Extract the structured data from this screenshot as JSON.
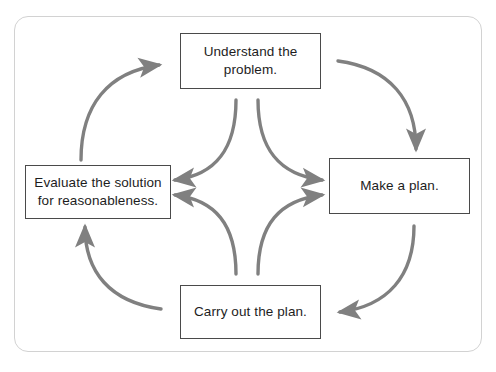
{
  "diagram": {
    "type": "cycle-flowchart",
    "frame_color": "#d2d2d2",
    "arrow_color": "#808080",
    "box_border_color": "#4a4a4a",
    "text_color": "#1d1d1d",
    "background_color": "#ffffff",
    "nodes": [
      {
        "id": "understand",
        "label": "Understand the\nproblem.",
        "position": "top"
      },
      {
        "id": "makeplan",
        "label": "Make a plan.",
        "position": "right"
      },
      {
        "id": "carryout",
        "label": "Carry out the plan.",
        "position": "bottom"
      },
      {
        "id": "evaluate",
        "label": "Evaluate the solution\nfor reasonableness.",
        "position": "left"
      }
    ],
    "outer_arrows": [
      {
        "id": "evaluate-to-understand",
        "from": "evaluate",
        "to": "understand",
        "side": "top-left"
      },
      {
        "id": "understand-to-makeplan",
        "from": "understand",
        "to": "makeplan",
        "side": "top-right"
      },
      {
        "id": "makeplan-to-carryout",
        "from": "makeplan",
        "to": "carryout",
        "side": "bottom-right"
      },
      {
        "id": "carryout-to-evaluate",
        "from": "carryout",
        "to": "evaluate",
        "side": "bottom-left"
      }
    ],
    "inner_arrows": [
      {
        "id": "understand-to-evaluate",
        "from": "understand",
        "to": "evaluate",
        "side": "center-upper-left"
      },
      {
        "id": "understand-to-makeplan-inner",
        "from": "understand",
        "to": "makeplan",
        "side": "center-upper-right"
      },
      {
        "id": "carryout-to-evaluate-inner",
        "from": "carryout",
        "to": "evaluate",
        "side": "center-lower-left"
      },
      {
        "id": "carryout-to-makeplan-inner",
        "from": "carryout",
        "to": "makeplan",
        "side": "center-lower-right"
      }
    ]
  }
}
